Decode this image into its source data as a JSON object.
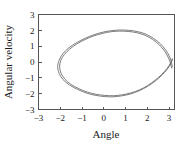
{
  "chart_data": {
    "type": "line",
    "title": "",
    "xlabel": "Angle",
    "ylabel": "Angular velocity",
    "xlim": [
      -3,
      3.25
    ],
    "ylim": [
      -3,
      3
    ],
    "xticks": [
      -3,
      -2,
      -1,
      0,
      1,
      2,
      3
    ],
    "xtick_labels": [
      "-3",
      "-2",
      "-1",
      "0",
      "1",
      "2",
      "3"
    ],
    "yticks": [
      -3,
      -2,
      -1,
      0,
      1,
      2,
      3
    ],
    "ytick_labels": [
      "-3",
      "-2",
      "-1",
      "0",
      "1",
      "2",
      "3"
    ],
    "grid": false,
    "legend": null,
    "line_color": "#6e6e6e",
    "frame_color": "#555555",
    "background": "#ffffff",
    "series": [
      {
        "name": "orbit-outer",
        "points": [
          [
            3.15,
            -0.3
          ],
          [
            3.05,
            0.25
          ],
          [
            2.85,
            0.75
          ],
          [
            2.6,
            1.15
          ],
          [
            2.3,
            1.48
          ],
          [
            1.95,
            1.75
          ],
          [
            1.55,
            1.92
          ],
          [
            1.15,
            2.0
          ],
          [
            0.75,
            2.02
          ],
          [
            0.35,
            1.98
          ],
          [
            -0.05,
            1.88
          ],
          [
            -0.45,
            1.72
          ],
          [
            -0.85,
            1.5
          ],
          [
            -1.25,
            1.22
          ],
          [
            -1.6,
            0.9
          ],
          [
            -1.88,
            0.52
          ],
          [
            -2.05,
            0.12
          ],
          [
            -2.12,
            -0.3
          ],
          [
            -2.05,
            -0.72
          ],
          [
            -1.88,
            -1.1
          ],
          [
            -1.58,
            -1.45
          ],
          [
            -1.22,
            -1.72
          ],
          [
            -0.82,
            -1.95
          ],
          [
            -0.4,
            -2.1
          ],
          [
            0.02,
            -2.18
          ],
          [
            0.42,
            -2.2
          ],
          [
            0.82,
            -2.14
          ],
          [
            1.22,
            -2.02
          ],
          [
            1.62,
            -1.82
          ],
          [
            2.0,
            -1.55
          ],
          [
            2.35,
            -1.22
          ],
          [
            2.66,
            -0.85
          ],
          [
            2.92,
            -0.45
          ],
          [
            3.1,
            -0.05
          ],
          [
            3.16,
            0.2
          ]
        ]
      },
      {
        "name": "orbit-inner",
        "points": [
          [
            3.12,
            -0.38
          ],
          [
            3.0,
            0.18
          ],
          [
            2.8,
            0.68
          ],
          [
            2.55,
            1.08
          ],
          [
            2.25,
            1.42
          ],
          [
            1.9,
            1.68
          ],
          [
            1.52,
            1.85
          ],
          [
            1.12,
            1.93
          ],
          [
            0.72,
            1.95
          ],
          [
            0.32,
            1.91
          ],
          [
            -0.08,
            1.8
          ],
          [
            -0.48,
            1.64
          ],
          [
            -0.86,
            1.42
          ],
          [
            -1.24,
            1.14
          ],
          [
            -1.56,
            0.82
          ],
          [
            -1.82,
            0.46
          ],
          [
            -1.98,
            0.08
          ],
          [
            -2.03,
            -0.32
          ],
          [
            -1.96,
            -0.72
          ],
          [
            -1.79,
            -1.08
          ],
          [
            -1.5,
            -1.42
          ],
          [
            -1.15,
            -1.68
          ],
          [
            -0.76,
            -1.9
          ],
          [
            -0.35,
            -2.04
          ],
          [
            0.05,
            -2.11
          ],
          [
            0.45,
            -2.13
          ],
          [
            0.85,
            -2.07
          ],
          [
            1.25,
            -1.95
          ],
          [
            1.64,
            -1.76
          ],
          [
            2.01,
            -1.49
          ],
          [
            2.35,
            -1.16
          ],
          [
            2.65,
            -0.8
          ],
          [
            2.9,
            -0.42
          ],
          [
            3.07,
            -0.06
          ],
          [
            3.13,
            0.16
          ]
        ]
      }
    ]
  }
}
